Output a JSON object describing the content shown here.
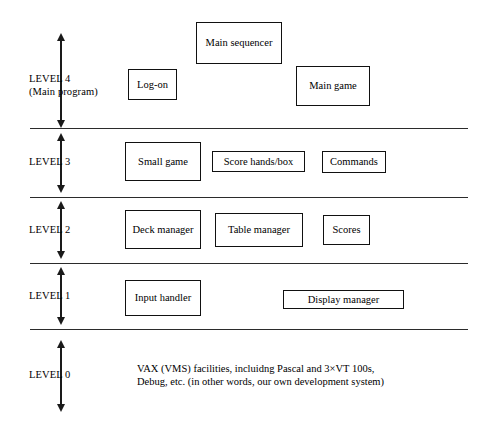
{
  "diagram": {
    "type": "layered-block-diagram",
    "line_color": "#2b2b2b",
    "box_border_color": "#111111",
    "background_color": "#ffffff",
    "levels": [
      {
        "id": "level-4",
        "label": "LEVEL 4",
        "sublabel": "(Main program)",
        "boxes": [
          {
            "id": "log-on",
            "label": "Log-on"
          },
          {
            "id": "main-sequencer",
            "label": "Main sequencer"
          },
          {
            "id": "main-game",
            "label": "Main game"
          }
        ]
      },
      {
        "id": "level-3",
        "label": "LEVEL 3",
        "sublabel": "",
        "boxes": [
          {
            "id": "small-game",
            "label": "Small game"
          },
          {
            "id": "score-hands-box",
            "label": "Score hands/box"
          },
          {
            "id": "commands",
            "label": "Commands"
          }
        ]
      },
      {
        "id": "level-2",
        "label": "LEVEL 2",
        "sublabel": "",
        "boxes": [
          {
            "id": "deck-manager",
            "label": "Deck manager"
          },
          {
            "id": "table-manager",
            "label": "Table manager"
          },
          {
            "id": "scores",
            "label": "Scores"
          }
        ]
      },
      {
        "id": "level-1",
        "label": "LEVEL 1",
        "sublabel": "",
        "boxes": [
          {
            "id": "input-handler",
            "label": "Input handler"
          },
          {
            "id": "display-manager",
            "label": "Display manager"
          }
        ]
      },
      {
        "id": "level-0",
        "label": "LEVEL 0",
        "sublabel": "",
        "text_line_1": "VAX (VMS) facilities, incluidng Pascal and 3×VT 100s,",
        "text_line_2": "Debug, etc. (in other words, our own development system)"
      }
    ]
  }
}
